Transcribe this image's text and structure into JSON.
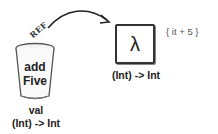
{
  "diagram": {
    "variable": {
      "name_line1": "add",
      "name_line2": "Five",
      "keyword": "val",
      "type": "(Int) -> Int"
    },
    "reference_label": "REF",
    "lambda": {
      "symbol": "λ",
      "body": "{ it + 5 }",
      "type": "(Int) -> Int"
    }
  }
}
